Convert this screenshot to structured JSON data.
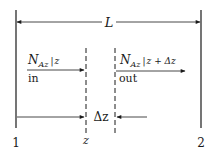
{
  "diagram": {
    "type": "control-volume shell balance",
    "length_label": "L",
    "flux_in": {
      "symbol": "N",
      "subscript": "Az",
      "evaluated_at": "z",
      "direction_label": "in"
    },
    "flux_out": {
      "symbol": "N",
      "subscript": "Az",
      "evaluated_at": "z + Δz",
      "direction_label": "out"
    },
    "element_width_label": "Δz",
    "position_label": "z",
    "boundary_labels": [
      "1",
      "2"
    ],
    "colors": {
      "line": "#1a1a1a",
      "background": "#ffffff"
    }
  }
}
